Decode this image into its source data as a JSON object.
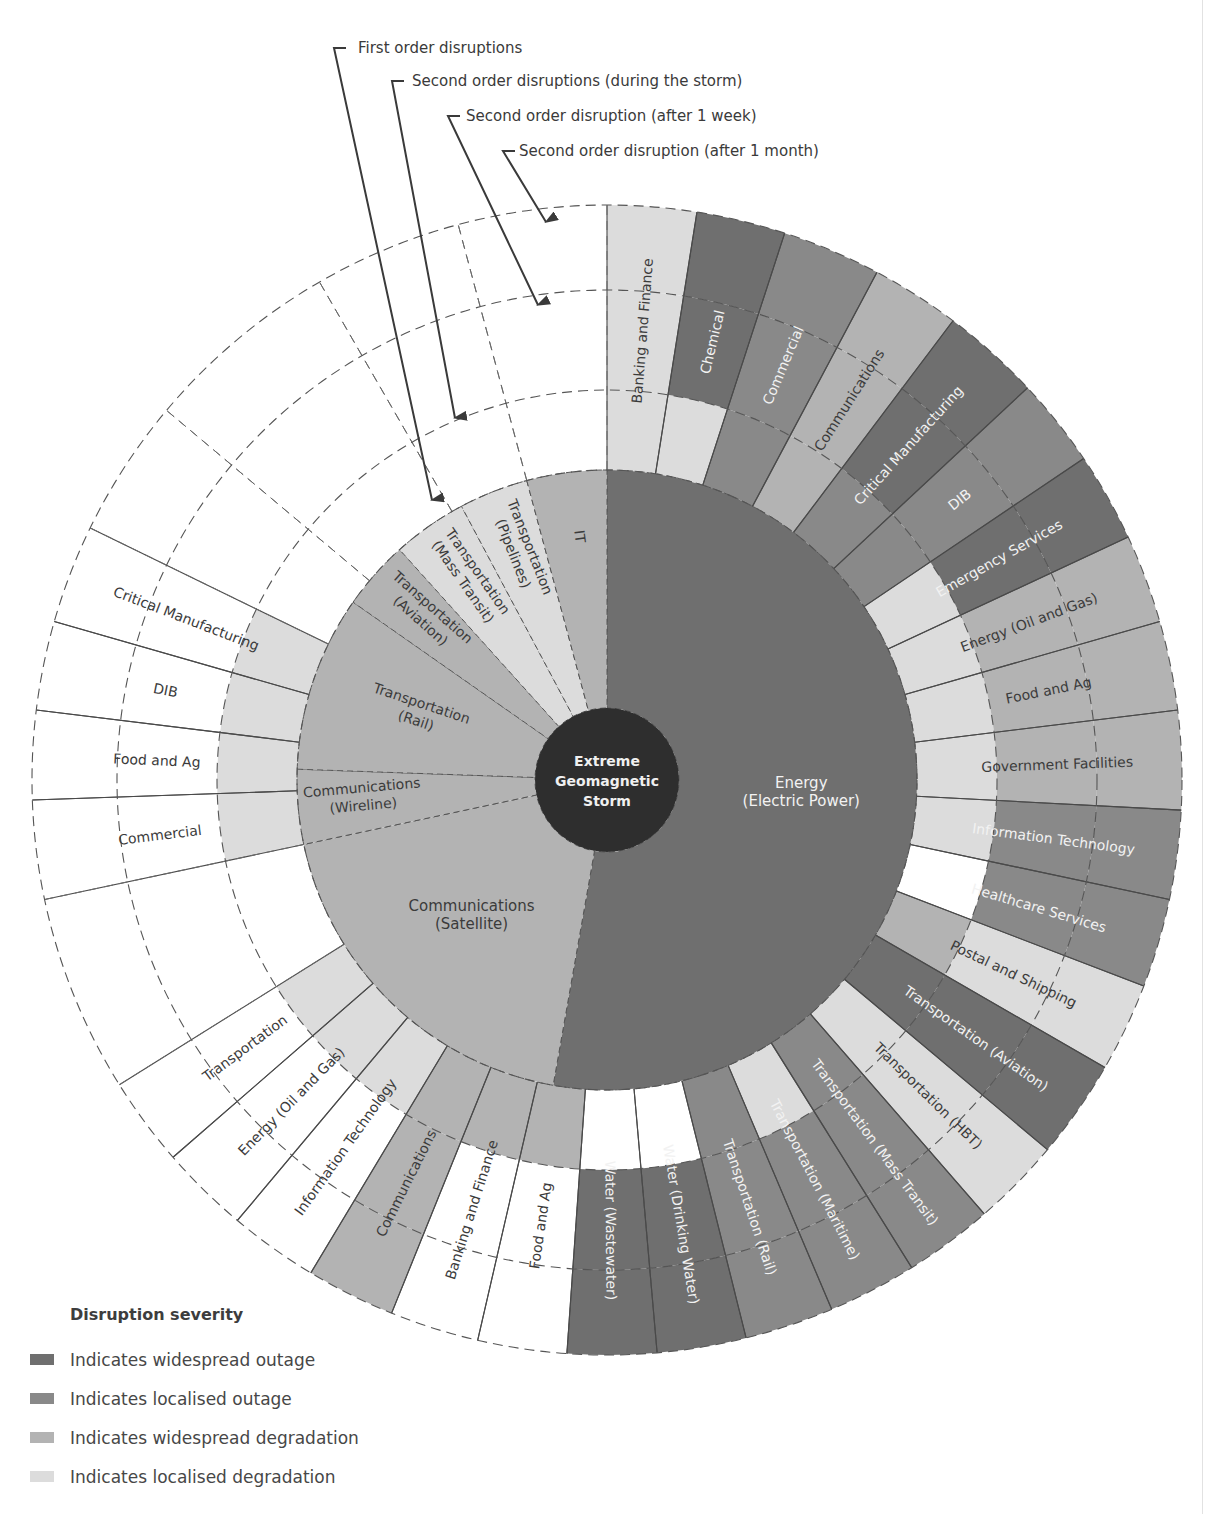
{
  "chart_data": {
    "type": "sunburst",
    "title": "",
    "center": {
      "label": [
        "Extreme",
        "Geomagnetic",
        "Storm"
      ]
    },
    "ring_labels": [
      "First order disruptions",
      "Second order disruptions (during the storm)",
      "Second order disruption (after 1 week)",
      "Second order disruption (after 1 month)"
    ],
    "severity_levels": {
      "widespread_outage": {
        "label": "Indicates widespread outage",
        "color": "#6f6f6f"
      },
      "localised_outage": {
        "label": "Indicates localised outage",
        "color": "#898989"
      },
      "widespread_degradation": {
        "label": "Indicates widespread degradation",
        "color": "#b3b3b3"
      },
      "localised_degradation": {
        "label": "Indicates localised degradation",
        "color": "#dcdcdc"
      },
      "none": {
        "label": "",
        "color": "#ffffff"
      }
    },
    "first_order": [
      {
        "name": [
          "Energy",
          "(Electric Power)"
        ],
        "start": 0,
        "end": 190,
        "severity": "widespread_outage"
      },
      {
        "name": [
          "Communications",
          "(Satellite)"
        ],
        "start": 190,
        "end": 258,
        "severity": "widespread_degradation"
      },
      {
        "name": [
          "Communications",
          "(Wireline)"
        ],
        "start": 258,
        "end": 272,
        "severity": "widespread_degradation"
      },
      {
        "name": [
          "Transportation",
          "(Rail)"
        ],
        "start": 272,
        "end": 305,
        "severity": "widespread_degradation"
      },
      {
        "name": [
          "Transportation",
          "(Aviation)"
        ],
        "start": 305,
        "end": 318,
        "severity": "widespread_degradation"
      },
      {
        "name": [
          "Transportation",
          "(Mass Transit)"
        ],
        "start": 318,
        "end": 332,
        "severity": "localised_degradation"
      },
      {
        "name": [
          "Transportation",
          "(Pipelines)"
        ],
        "start": 332,
        "end": 345,
        "severity": "localised_degradation"
      },
      {
        "name": [
          "IT"
        ],
        "start": 345,
        "end": 360,
        "severity": "widespread_degradation"
      }
    ],
    "second_order": [
      {
        "name": "Banking and Finance",
        "start": 0,
        "end": 9,
        "during": "localised_degradation",
        "week": "localised_degradation",
        "month": "localised_degradation"
      },
      {
        "name": "Chemical",
        "start": 9,
        "end": 18,
        "during": "localised_degradation",
        "week": "widespread_outage",
        "month": "widespread_outage"
      },
      {
        "name": "Commercial",
        "start": 18,
        "end": 28,
        "during": "localised_outage",
        "week": "localised_outage",
        "month": "localised_outage"
      },
      {
        "name": "Communications",
        "start": 28,
        "end": 37,
        "during": "widespread_degradation",
        "week": "widespread_degradation",
        "month": "widespread_degradation"
      },
      {
        "name": "Critical Manufacturing",
        "start": 37,
        "end": 47,
        "during": "localised_outage",
        "week": "widespread_outage",
        "month": "widespread_outage"
      },
      {
        "name": "DIB",
        "start": 47,
        "end": 56,
        "during": "localised_outage",
        "week": "localised_outage",
        "month": "localised_outage"
      },
      {
        "name": "Emergency Services",
        "start": 56,
        "end": 65,
        "during": "localised_degradation",
        "week": "widespread_outage",
        "month": "widespread_outage"
      },
      {
        "name": "Energy (Oil and Gas)",
        "start": 65,
        "end": 74,
        "during": "localised_degradation",
        "week": "widespread_degradation",
        "month": "widespread_degradation"
      },
      {
        "name": "Food and Ag",
        "start": 74,
        "end": 83,
        "during": "localised_degradation",
        "week": "widespread_degradation",
        "month": "widespread_degradation"
      },
      {
        "name": "Government Facilities",
        "start": 83,
        "end": 93,
        "during": "localised_degradation",
        "week": "widespread_degradation",
        "month": "widespread_degradation"
      },
      {
        "name": "Information Technology",
        "start": 93,
        "end": 102,
        "during": "localised_degradation",
        "week": "localised_outage",
        "month": "localised_outage"
      },
      {
        "name": "Healthcare Services",
        "start": 102,
        "end": 111,
        "during": "none",
        "week": "localised_outage",
        "month": "localised_outage"
      },
      {
        "name": "Postal and Shipping",
        "start": 111,
        "end": 120,
        "during": "widespread_degradation",
        "week": "localised_degradation",
        "month": "localised_degradation"
      },
      {
        "name": "Transportation (Aviation)",
        "start": 120,
        "end": 130,
        "during": "widespread_outage",
        "week": "widespread_outage",
        "month": "widespread_outage"
      },
      {
        "name": "Transportation (HBT)",
        "start": 130,
        "end": 139,
        "during": "localised_degradation",
        "week": "localised_degradation",
        "month": "localised_degradation"
      },
      {
        "name": "Transportation (Mass Transit)",
        "start": 139,
        "end": 148,
        "during": "localised_outage",
        "week": "localised_outage",
        "month": "localised_outage"
      },
      {
        "name": "Transportation (Maritime)",
        "start": 148,
        "end": 157,
        "during": "localised_degradation",
        "week": "localised_outage",
        "month": "localised_outage"
      },
      {
        "name": "Transportation (Rail)",
        "start": 157,
        "end": 166,
        "during": "localised_outage",
        "week": "localised_outage",
        "month": "localised_outage"
      },
      {
        "name": "Water (Drinking Water)",
        "start": 166,
        "end": 175,
        "during": "none",
        "week": "widespread_outage",
        "month": "widespread_outage"
      },
      {
        "name": "Water (Wastewater)",
        "start": 175,
        "end": 184,
        "during": "none",
        "week": "widespread_outage",
        "month": "widespread_outage"
      },
      {
        "name": "Food and Ag",
        "start": 184,
        "end": 193,
        "during": "widespread_degradation",
        "week": "none",
        "month": "none"
      },
      {
        "name": "Banking and Finance",
        "start": 193,
        "end": 202,
        "during": "widespread_degradation",
        "week": "none",
        "month": "none"
      },
      {
        "name": "Communications",
        "start": 202,
        "end": 211,
        "during": "widespread_degradation",
        "week": "widespread_degradation",
        "month": "widespread_degradation"
      },
      {
        "name": "Information Technology",
        "start": 211,
        "end": 220,
        "during": "localised_degradation",
        "week": "none",
        "month": "none"
      },
      {
        "name": "Energy (Oil and Gas)",
        "start": 220,
        "end": 229,
        "during": "localised_degradation",
        "week": "none",
        "month": "none"
      },
      {
        "name": "Transportation",
        "start": 229,
        "end": 238,
        "during": "localised_degradation",
        "week": "none",
        "month": "none"
      },
      {
        "name": "",
        "start": 238,
        "end": 258,
        "during": "none",
        "week": "none",
        "month": "none"
      },
      {
        "name": "Commercial",
        "start": 258,
        "end": 268,
        "during": "localised_degradation",
        "week": "none",
        "month": "none"
      },
      {
        "name": "Food and Ag",
        "start": 268,
        "end": 277,
        "during": "localised_degradation",
        "week": "none",
        "month": "none"
      },
      {
        "name": "DIB",
        "start": 277,
        "end": 286,
        "during": "localised_degradation",
        "week": "none",
        "month": "none"
      },
      {
        "name": "Critical Manufacturing",
        "start": 286,
        "end": 296,
        "during": "localised_degradation",
        "week": "none",
        "month": "none"
      },
      {
        "name": "",
        "start": 296,
        "end": 360,
        "during": "none",
        "week": "none",
        "month": "none"
      }
    ]
  },
  "legend": {
    "title": "Disruption severity",
    "items": [
      {
        "label": "Indicates widespread outage",
        "color": "#6f6f6f"
      },
      {
        "label": "Indicates localised outage",
        "color": "#898989"
      },
      {
        "label": "Indicates widespread degradation",
        "color": "#b3b3b3"
      },
      {
        "label": "Indicates localised degradation",
        "color": "#dcdcdc"
      }
    ]
  }
}
